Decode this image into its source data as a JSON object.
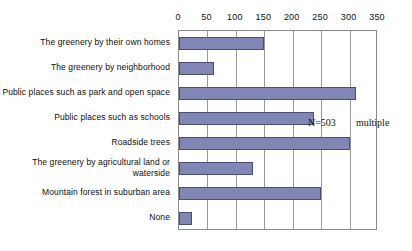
{
  "chart_data": {
    "type": "bar",
    "orientation": "horizontal",
    "title": "",
    "xlabel": "",
    "ylabel": "",
    "categories": [
      "The greenery by their own homes",
      "The greenery by neighborhood",
      "Public places such as park and open space",
      "Public places such as schools",
      "Roadside trees",
      "The greenery by agricultural land or waterside",
      "Mountain forest in suburban area",
      "None"
    ],
    "values": [
      150,
      62,
      311,
      238,
      300,
      131,
      249,
      22
    ],
    "xlim": [
      0,
      350
    ],
    "xticks": [
      0,
      50,
      100,
      150,
      200,
      250,
      300,
      350
    ],
    "xtick_labels": [
      "0",
      "50",
      "100",
      "150",
      "200",
      "250",
      "300",
      "350"
    ],
    "grid": true,
    "grid_axis": "x",
    "legend": "none",
    "bar_color": "#8186b5",
    "bar_edge_color": "#4b4f77",
    "frame_color": "#8a8a8a",
    "annotations": [
      {
        "name": "sample-size",
        "text": "N=503"
      },
      {
        "name": "multiple-answer-note",
        "text": "multiple"
      }
    ]
  },
  "annotations": {
    "sample_size": "N=503",
    "multiple": "multiple"
  }
}
